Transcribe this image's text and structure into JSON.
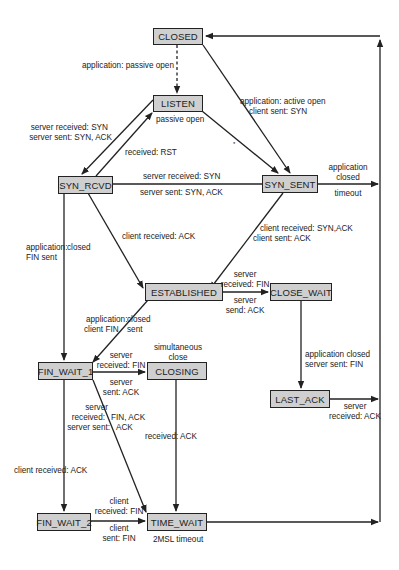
{
  "diagram": {
    "states": {
      "closed": "CLOSED",
      "listen": "LISTEN",
      "syn_rcvd": "SYN_RCVD",
      "syn_sent": "SYN_SENT",
      "established": "ESTABLISHED",
      "close_wait": "CLOSE_WAIT",
      "fin_wait_1": "FIN_WAIT_1",
      "closing": "CLOSING",
      "last_ack": "LAST_ACK",
      "fin_wait_2": "FIN_WAIT_2",
      "time_wait": "TIME_WAIT"
    },
    "transitions": {
      "closed_listen": "application: passive open",
      "closed_synsent_1": "application: active open",
      "closed_synsent_2": "client sent: SYN",
      "listen_synrcvd_1": "server received: SYN",
      "listen_synrcvd_2": "server sent: SYN, ACK",
      "synrcvd_listen": "received: RST",
      "passive_open": "passive open",
      "listen_synsent_mark": "*",
      "synrcvd_synsent_1": "server received: SYN",
      "synrcvd_synsent_2": "server sent: SYN, ACK",
      "synsent_closed_1": "application",
      "synsent_closed_2": "closed",
      "synsent_closed_3": "timeout",
      "synrcvd_finwait1_1": "application:",
      "synrcvd_finwait1_2": "closed",
      "synrcvd_finwait1_3": "FIN sent",
      "synrcvd_est": "client received: ACK",
      "synsent_est_1": "client received: SYN,ACK",
      "synsent_est_2": "client sent: ACK",
      "est_closewait_1": "server",
      "est_closewait_2": "received: FIN",
      "est_closewait_3": "server",
      "est_closewait_4": "send: ACK",
      "est_finwait1_1": "application:",
      "est_finwait1_2": "closed",
      "est_finwait1_3": "client FIN",
      "est_finwait1_4": "sent",
      "closewait_lastack_1": "application closed",
      "closewait_lastack_2": "server sent: FIN",
      "lastack_closed_1": "server",
      "lastack_closed_2": "received: ACK",
      "finwait1_closing_1": "server",
      "finwait1_closing_2": "received: FIN",
      "finwait1_closing_3": "server",
      "finwait1_closing_4": "sent: ACK",
      "simultaneous_1": "simultaneous",
      "simultaneous_2": "close",
      "finwait1_timewait_1": "server",
      "finwait1_timewait_2": "received:",
      "finwait1_timewait_3": "FIN, ACK",
      "finwait1_timewait_4": "server sent:",
      "finwait1_timewait_5": "ACK",
      "closing_timewait": "received: ACK",
      "finwait1_finwait2": "client received: ACK",
      "finwait2_timewait_1": "client",
      "finwait2_timewait_2": "received: FIN",
      "finwait2_timewait_3": "client",
      "finwait2_timewait_4": "sent: FIN",
      "timewait_closed": "2MSL timeout"
    },
    "colors": {
      "state_fill": "#cfcfcf",
      "line": "#222222",
      "background": "#ffffff"
    }
  }
}
